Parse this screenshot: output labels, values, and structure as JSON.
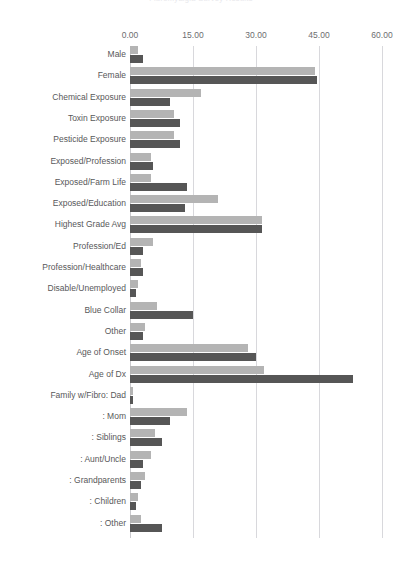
{
  "chart_data": {
    "type": "bar",
    "orientation": "horizontal",
    "title": "Fibromyalgia Survey Results",
    "xlabel": "",
    "ylabel": "",
    "xlim": [
      0,
      60
    ],
    "xticks": [
      "0.00",
      "15.00",
      "30.00",
      "45.00",
      "60.00"
    ],
    "xtick_values": [
      0,
      15,
      30,
      45,
      60
    ],
    "grid": true,
    "legend": "none",
    "categories": [
      "Male",
      "Female",
      "Chemical Exposure",
      "Toxin Exposure",
      "Pesticide Exposure",
      "Exposed/Profession",
      "Exposed/Farm Life",
      "Exposed/Education",
      "Highest Grade Avg",
      "Profession/Ed",
      "Profession/Healthcare",
      "Disable/Unemployed",
      "Blue Collar",
      "Other",
      "Age of Onset",
      "Age of Dx",
      "Family w/Fibro: Dad",
      ": Mom",
      ": Siblings",
      ": Aunt/Uncle",
      ": Grandparents",
      ": Children",
      ": Other"
    ],
    "series": [
      {
        "name": "Series 1",
        "color": "#b4b4b4",
        "values": [
          1.8,
          44.0,
          17.0,
          10.5,
          10.5,
          5.0,
          5.0,
          21.0,
          31.5,
          5.5,
          2.5,
          2.0,
          6.5,
          3.5,
          28.0,
          32.0,
          0.8,
          13.5,
          6.0,
          5.0,
          3.5,
          2.0,
          2.5
        ]
      },
      {
        "name": "Series 2",
        "color": "#565656",
        "values": [
          3.0,
          44.5,
          9.5,
          12.0,
          12.0,
          5.5,
          13.5,
          13.0,
          31.5,
          3.0,
          3.0,
          1.5,
          15.0,
          3.0,
          30.0,
          53.0,
          0.8,
          9.5,
          7.5,
          3.0,
          2.5,
          1.5,
          7.5
        ]
      }
    ]
  }
}
